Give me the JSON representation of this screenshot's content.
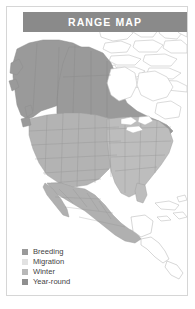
{
  "card": {
    "title": "RANGE MAP",
    "frame_color": "#d6d6d6",
    "background": "#ffffff"
  },
  "title_bar": {
    "label": "RANGE MAP",
    "background": "#8a8a8a",
    "text_color": "#ffffff"
  },
  "legend": {
    "items": [
      {
        "label": "Breeding",
        "color": "#9a9a9a"
      },
      {
        "label": "Migration",
        "color": "#e2e2e2"
      },
      {
        "label": "Winter",
        "color": "#b8b8b8"
      },
      {
        "label": "Year-round",
        "color": "#8f8f8f"
      }
    ]
  },
  "map": {
    "region": "North America",
    "ocean_color": "#ffffff",
    "outline_color": "#b0b0b0",
    "border_color": "#9d9d9d",
    "fills": {
      "breeding": "#9a9a9a",
      "migration": "#e2e2e2",
      "winter": "#b8b8b8",
      "year_round": "#8f8f8f",
      "unshaded_land": "#ffffff"
    }
  }
}
